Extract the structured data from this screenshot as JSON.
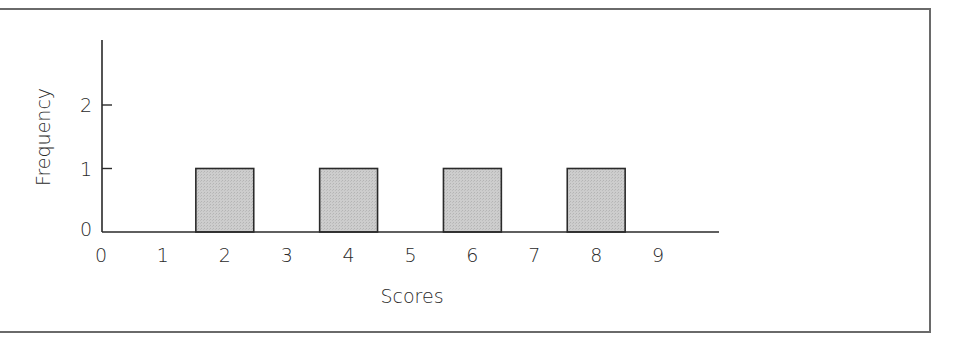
{
  "chart_data": {
    "type": "bar",
    "title": "",
    "xlabel": "Scores",
    "ylabel": "Frequency",
    "x_ticks": [
      "0",
      "1",
      "2",
      "3",
      "4",
      "5",
      "6",
      "7",
      "8",
      "9"
    ],
    "y_ticks": [
      "0",
      "1",
      "2"
    ],
    "categories": [
      "2",
      "4",
      "6",
      "8"
    ],
    "values": [
      1,
      1,
      1,
      1
    ],
    "xlim": [
      0,
      10
    ],
    "ylim": [
      0,
      3
    ],
    "grid": false,
    "legend": null,
    "bar_color": "#c8c8c8",
    "bar_edge_color": "#2a2a2a"
  },
  "axes": {
    "x_label": "Scores",
    "y_label": "Frequency"
  }
}
